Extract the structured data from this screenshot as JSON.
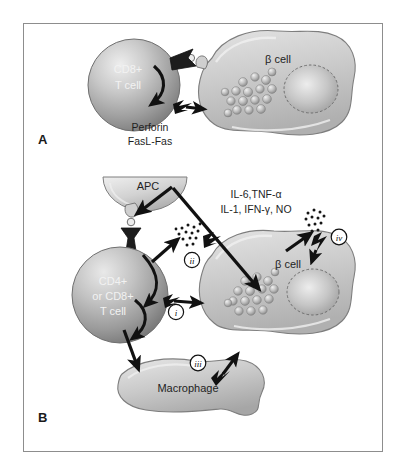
{
  "figure": {
    "border_color": "#8d8d8d",
    "background_color": "#ffffff"
  },
  "panels": [
    {
      "id": "A",
      "label": "A",
      "cells": [
        {
          "name": "cd8-t-cell",
          "label_line1": "CD8+",
          "label_line2": "T cell"
        },
        {
          "name": "beta-cell",
          "label": "β cell"
        }
      ],
      "annotations": [
        {
          "name": "perforin-label",
          "text": "Perforin"
        },
        {
          "name": "fasl-fas-label",
          "text": "FasL-Fas"
        }
      ]
    },
    {
      "id": "B",
      "label": "B",
      "cells": [
        {
          "name": "apc-cell",
          "label": "APC"
        },
        {
          "name": "cd4-cd8-t-cell",
          "label_line1": "CD4+",
          "label_line2": "or CD8+",
          "label_line3": "T cell"
        },
        {
          "name": "beta-cell",
          "label": "β cell"
        },
        {
          "name": "macrophage-cell",
          "label": "Macrophage"
        }
      ],
      "annotations": [
        {
          "name": "cytokine-label-line1",
          "text": "IL-6,TNF-α"
        },
        {
          "name": "cytokine-label-line2",
          "text": "IL-1, IFN-γ, NO"
        }
      ],
      "markers": [
        {
          "name": "pathway-marker-i",
          "text": "i"
        },
        {
          "name": "pathway-marker-ii",
          "text": "ii"
        },
        {
          "name": "pathway-marker-iii",
          "text": "iii"
        },
        {
          "name": "pathway-marker-iv",
          "text": "iv"
        }
      ]
    }
  ],
  "colors": {
    "cell_fill_light": "#d9d9d9",
    "cell_fill_mid": "#b5b5b5",
    "cell_fill_dark": "#8a8a8a",
    "arrow_black": "#111111",
    "outline": "#6f6f6f",
    "text_dark": "#1f1f1f",
    "text_light": "#f2f2f2"
  }
}
